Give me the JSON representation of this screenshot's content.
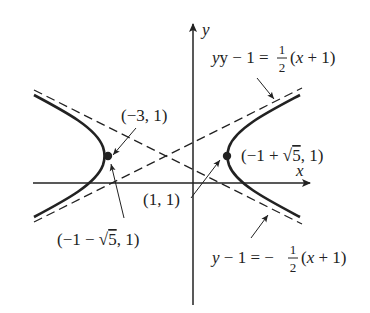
{
  "diagram": {
    "axes": {
      "x_label": "x",
      "y_label": "y"
    },
    "points": {
      "left_vertex_label": "(−3, 1)",
      "right_vertex_label_prefix": "(−1 + ",
      "right_vertex_label_root": "5",
      "right_vertex_label_suffix": ", 1)",
      "left_focus_label_prefix": "(−1 − ",
      "left_focus_label_root": "5",
      "left_focus_label_suffix": ", 1)",
      "focus_right_label": "(1, 1)"
    },
    "asymptotes": {
      "upper": {
        "lhs": "y − 1 = ",
        "num": "1",
        "den": "2",
        "rhs": "(x + 1)"
      },
      "lower": {
        "lhs": "y − 1 = −",
        "num": "1",
        "den": "2",
        "rhs": "(x + 1)"
      }
    },
    "colors": {
      "ink": "#222222",
      "background": "#ffffff"
    }
  }
}
